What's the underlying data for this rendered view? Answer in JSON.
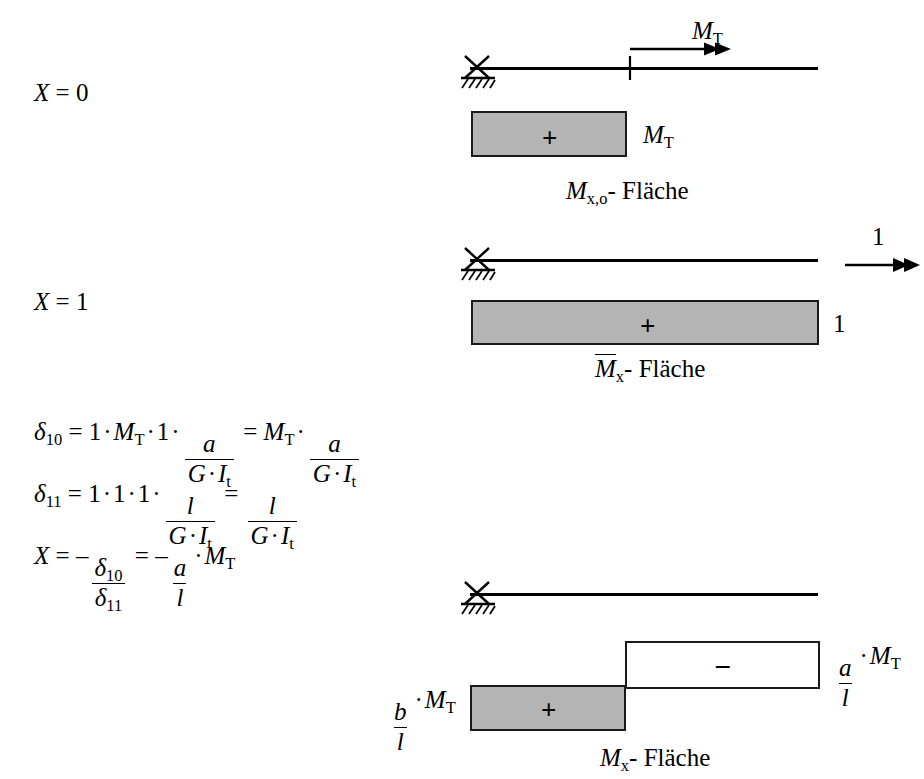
{
  "figure": {
    "kind": "torsion-moment-force-method-diagram",
    "units_note": "",
    "colors": {
      "diagram_fill_positive": "#b4b4b4",
      "diagram_fill_negative": "#ffffff",
      "stroke": "#1a1a1a",
      "background": "#ffffff"
    }
  },
  "case_labels": {
    "case0": "X = 0",
    "case1": "X = 1"
  },
  "diagram_top": {
    "load_label": "M",
    "load_sub": "T",
    "area_value_label": "M",
    "area_value_sub": "T",
    "sign": "+",
    "caption_symbol": "M",
    "caption_sub": "x,o",
    "caption_text": "- Fläche",
    "support": "pin-support-hatched",
    "arrow": "double-head-right"
  },
  "diagram_middle": {
    "load_label": "1",
    "area_value_label": "1",
    "sign": "+",
    "caption_symbol": "M",
    "caption_sub": "x",
    "caption_overline": true,
    "caption_text": "- Fläche",
    "support": "pin-support-hatched",
    "arrow": "double-head-right"
  },
  "diagram_bottom": {
    "left_label": {
      "num": "b",
      "den": "l",
      "dot": "·",
      "factor": "M",
      "factor_sub": "T"
    },
    "right_label": {
      "num": "a",
      "den": "l",
      "dot": "·",
      "factor": "M",
      "factor_sub": "T"
    },
    "sign_positive": "+",
    "sign_negative": "–",
    "caption_symbol": "M",
    "caption_sub": "x",
    "caption_text": "- Fläche",
    "support": "pin-support-hatched"
  },
  "equations": {
    "delta10": {
      "lhs_symbol": "δ",
      "lhs_sub": "10",
      "eq": "=",
      "terms": [
        "1",
        "·",
        "M",
        "T",
        "·",
        "1",
        "·"
      ],
      "frac1": {
        "num": "a",
        "den_g": "G",
        "den_dot": "·",
        "den_i": "I",
        "den_i_sub": "t"
      },
      "eq2": "=",
      "rhs_factor": "M",
      "rhs_factor_sub": "T",
      "rhs_dot": "·",
      "frac2": {
        "num": "a",
        "den_g": "G",
        "den_dot": "·",
        "den_i": "I",
        "den_i_sub": "t"
      }
    },
    "delta11": {
      "lhs_symbol": "δ",
      "lhs_sub": "11",
      "eq": "=",
      "terms": [
        "1",
        "·",
        "1",
        "·",
        "1",
        "·"
      ],
      "frac1": {
        "num": "l",
        "den_g": "G",
        "den_dot": "·",
        "den_i": "I",
        "den_i_sub": "t"
      },
      "eq2": "=",
      "frac2": {
        "num": "l",
        "den_g": "G",
        "den_dot": "·",
        "den_i": "I",
        "den_i_sub": "t"
      }
    },
    "x_result": {
      "lhs": "X",
      "eq": "=",
      "minus1": "–",
      "frac_num_symbol": "δ",
      "frac_num_sub": "10",
      "frac_den_symbol": "δ",
      "frac_den_sub": "11",
      "eq2": "=",
      "minus2": "–",
      "frac2_num": "a",
      "frac2_den": "l",
      "dot": "·",
      "factor": "M",
      "factor_sub": "T"
    }
  }
}
